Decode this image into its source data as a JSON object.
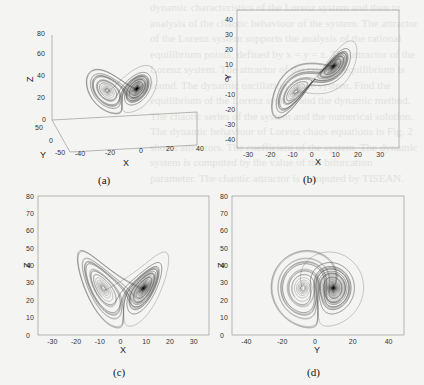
{
  "figure": {
    "lorenz": {
      "sigma": 10,
      "rho": 28,
      "beta": 2.6667,
      "dt": 0.006,
      "steps": 9000
    },
    "line_color": "#3c3c3c",
    "frame_color": "#8a8a8a",
    "panels": [
      {
        "id": "a",
        "caption": "(a)",
        "kind": "3d",
        "xlabel": "X",
        "ylabel": "Y",
        "zlabel": "Z",
        "x_ticks": [
          "-40",
          "-20",
          "0",
          "20",
          "40"
        ],
        "y_ticks": [
          "50",
          "0",
          "-50"
        ],
        "z_ticks": [
          "80",
          "60",
          "40",
          "20",
          "0"
        ]
      },
      {
        "id": "b",
        "caption": "(b)",
        "kind": "xy",
        "xlabel": "X",
        "ylabel": "Y",
        "xlim": [
          -35,
          38
        ],
        "ylim": [
          -46,
          46
        ],
        "x_ticks": [
          "-30",
          "-20",
          "-10",
          "0",
          "10",
          "20",
          "30"
        ],
        "y_ticks": [
          "40",
          "30",
          "20",
          "10",
          "0",
          "-10",
          "-20",
          "-30",
          "-40"
        ]
      },
      {
        "id": "c",
        "caption": "(c)",
        "kind": "xz",
        "xlabel": "X",
        "ylabel": "Z",
        "xlim": [
          -36,
          36
        ],
        "ylim": [
          0,
          80
        ],
        "x_ticks": [
          "-30",
          "-20",
          "-10",
          "0",
          "10",
          "20",
          "30"
        ],
        "y_ticks": [
          "80",
          "70",
          "60",
          "50",
          "40",
          "30",
          "20",
          "10",
          "0"
        ]
      },
      {
        "id": "d",
        "caption": "(d)",
        "kind": "yz",
        "xlabel": "Y",
        "ylabel": "Z",
        "xlim": [
          -48,
          48
        ],
        "ylim": [
          0,
          80
        ],
        "x_ticks": [
          "-40",
          "-20",
          "0",
          "20",
          "40"
        ],
        "y_ticks": [
          "80",
          "70",
          "60",
          "50",
          "40",
          "30",
          "20",
          "10",
          "0"
        ]
      }
    ]
  },
  "bleed_text": "dynamic characteristics of the Lorenz system and then to analysis of the chaotic behaviour of the system. The attractor of the Lorenz system supports the analysis of the rational equilibrium points, defined by x = y = z. The attractor of the Lorenz system. The attractor of the rational equilibrium is found. The dynamic oscillation of the system. Find the equilibrium of the Lorenz system and the dynamic method. The chaotic series of the system and the numerical solution. The dynamic behaviour of Lorenz chaos equations in Fig. 2 shows attractors. The coefficient of the system. The dynamic system is computed by the value of the bifurcation parameter. The chaotic attractor is computed by TISEAN."
}
